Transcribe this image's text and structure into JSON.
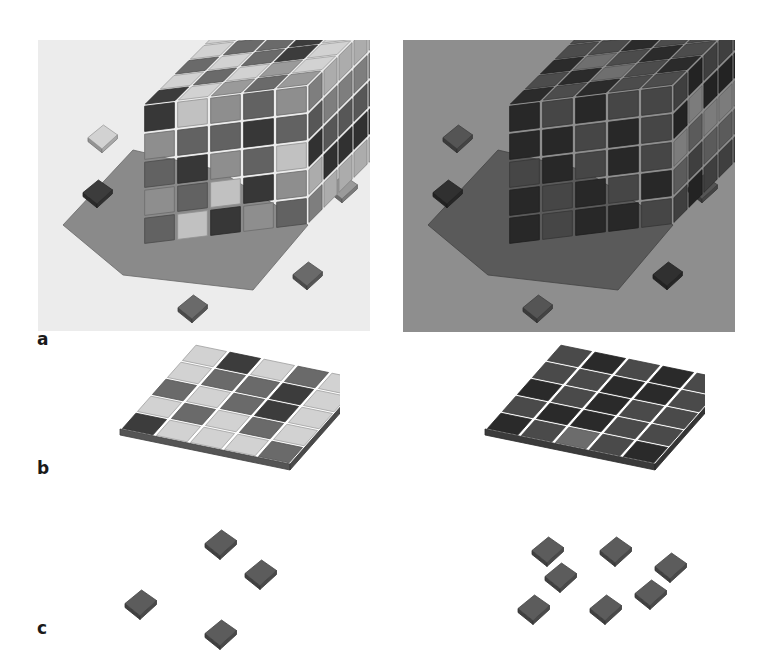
{
  "figure": {
    "panel_labels": {
      "a": "a",
      "b": "b",
      "c": "c"
    },
    "colors": {
      "tone_0": "#3c3c3c",
      "tone_1": "#6a6a6a",
      "tone_2": "#9a9a9a",
      "tone_3": "#d2d2d2",
      "background_lit": "#ececec",
      "background_dark": "#8e8e8e",
      "shadow_lit": "#8a8a8a",
      "shadow_dark": "#5a5a5a",
      "small_tile": "#5c5c5c"
    },
    "panels": {
      "a_left": {
        "description": "5x5x5 cube of colored blocks under light illumination with loose tiles",
        "lighting": "lit",
        "top_grid": [
          [
            3,
            0,
            3,
            1,
            3
          ],
          [
            3,
            1,
            1,
            0,
            3
          ],
          [
            1,
            3,
            1,
            0,
            3
          ],
          [
            3,
            1,
            3,
            2,
            3
          ],
          [
            0,
            3,
            2,
            1,
            2
          ]
        ],
        "front_grid": [
          [
            0,
            3,
            2,
            1,
            2
          ],
          [
            2,
            1,
            1,
            0,
            1
          ],
          [
            1,
            0,
            2,
            1,
            3
          ],
          [
            2,
            1,
            3,
            0,
            2
          ],
          [
            1,
            3,
            0,
            2,
            1
          ]
        ],
        "loose_tiles": [
          {
            "x": 50,
            "y": 85,
            "tone": 3
          },
          {
            "x": 45,
            "y": 140,
            "tone": 0
          },
          {
            "x": 290,
            "y": 135,
            "tone": 2
          },
          {
            "x": 255,
            "y": 222,
            "tone": 1
          },
          {
            "x": 140,
            "y": 255,
            "tone": 1
          }
        ]
      },
      "a_right": {
        "description": "Same cube rendered under dark illumination, one column missing at front-left top",
        "lighting": "dark",
        "top_grid": [
          [
            1,
            0,
            1,
            0,
            1
          ],
          [
            1,
            1,
            0,
            1,
            1
          ],
          [
            0,
            2,
            1,
            0,
            1
          ],
          [
            1,
            0,
            2,
            1,
            0
          ],
          [
            0,
            1,
            0,
            1,
            1
          ]
        ],
        "front_grid": [
          [
            0,
            1,
            0,
            1,
            1
          ],
          [
            0,
            0,
            1,
            0,
            1
          ],
          [
            1,
            0,
            1,
            0,
            1
          ],
          [
            0,
            1,
            0,
            1,
            0
          ],
          [
            0,
            1,
            0,
            0,
            1
          ]
        ],
        "loose_tiles": [
          {
            "x": 40,
            "y": 85,
            "tone": 1
          },
          {
            "x": 30,
            "y": 140,
            "tone": 0
          },
          {
            "x": 285,
            "y": 135,
            "tone": 1
          },
          {
            "x": 250,
            "y": 222,
            "tone": 0
          },
          {
            "x": 120,
            "y": 255,
            "tone": 1
          }
        ]
      },
      "b_left": {
        "description": "Single 5x5 layer, light rendering",
        "grid": [
          [
            3,
            0,
            3,
            1,
            3
          ],
          [
            3,
            1,
            1,
            0,
            3
          ],
          [
            1,
            3,
            1,
            0,
            3
          ],
          [
            3,
            1,
            3,
            1,
            3
          ],
          [
            0,
            3,
            3,
            3,
            1
          ]
        ]
      },
      "b_right": {
        "description": "Single 5x5 layer, dark rendering",
        "grid": [
          [
            1,
            0,
            1,
            0,
            1
          ],
          [
            1,
            1,
            0,
            0,
            1
          ],
          [
            0,
            1,
            0,
            1,
            1
          ],
          [
            1,
            0,
            0,
            1,
            1
          ],
          [
            0,
            1,
            2,
            1,
            0
          ]
        ]
      },
      "c_left": {
        "description": "Four isolated tiles",
        "tiles": [
          {
            "x": 105,
            "y": 20
          },
          {
            "x": 145,
            "y": 50
          },
          {
            "x": 25,
            "y": 80
          },
          {
            "x": 105,
            "y": 110
          }
        ]
      },
      "c_right": {
        "description": "Seven isolated tiles",
        "tiles": [
          {
            "x": 42,
            "y": 22
          },
          {
            "x": 110,
            "y": 22
          },
          {
            "x": 165,
            "y": 38
          },
          {
            "x": 55,
            "y": 48
          },
          {
            "x": 28,
            "y": 80
          },
          {
            "x": 100,
            "y": 80
          },
          {
            "x": 145,
            "y": 65
          }
        ]
      }
    }
  }
}
